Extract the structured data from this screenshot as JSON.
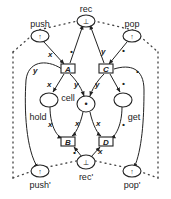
{
  "diagram": {
    "type": "petri-net",
    "places": {
      "rec": {
        "label": "rec",
        "token": "⊥"
      },
      "push": {
        "label": "push",
        "token": "↑"
      },
      "pop": {
        "label": "pop",
        "token": "↑"
      },
      "cell": {
        "label": "cell",
        "token": "•"
      },
      "hold": {
        "label": "hold",
        "token": ""
      },
      "get": {
        "label": "get",
        "token": ""
      },
      "rec_prime": {
        "label": "rec'",
        "token": "⊥"
      },
      "push_prime": {
        "label": "push'",
        "token": "↑"
      },
      "pop_prime": {
        "label": "pop'",
        "token": "↑"
      }
    },
    "transitions": {
      "A": {
        "label": "A"
      },
      "B": {
        "label": "B"
      },
      "C": {
        "label": "C"
      },
      "D": {
        "label": "D"
      }
    },
    "arc_labels": {
      "push_A": "x",
      "A_rec": "•",
      "C_rec": "y",
      "pop_C": "•",
      "A_pushp": "y",
      "A_hold": "x",
      "A_cell": "y",
      "C_cell": "y",
      "C_get": "•",
      "C_popp": "•",
      "hold_B": "x",
      "cell_B": "x",
      "cell_D": "x",
      "get_D": "•",
      "recp_B": "•",
      "recp_D": "x"
    }
  }
}
